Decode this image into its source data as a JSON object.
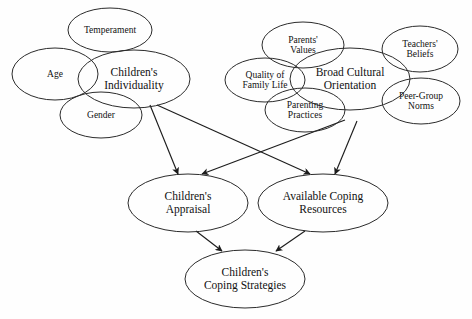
{
  "diagram": {
    "type": "concept-map",
    "background_color": "#fefefe",
    "stroke_color": "#2b2b2b",
    "text_color": "#111111",
    "nodes": [
      {
        "id": "temperament",
        "label": "Temperament",
        "cx": 110,
        "cy": 30,
        "rx": 42,
        "ry": 22,
        "font_size": 9.5
      },
      {
        "id": "age",
        "label": "Age",
        "cx": 55,
        "cy": 74,
        "rx": 43,
        "ry": 26,
        "font_size": 9.5
      },
      {
        "id": "individuality",
        "label": "Children's\nIndividuality",
        "cx": 134,
        "cy": 79,
        "rx": 56,
        "ry": 29,
        "font_size": 11.5
      },
      {
        "id": "gender",
        "label": "Gender",
        "cx": 101,
        "cy": 115,
        "rx": 41,
        "ry": 23,
        "font_size": 9.5
      },
      {
        "id": "parents_values",
        "label": "Parents'\nValues",
        "cx": 303,
        "cy": 45,
        "rx": 41,
        "ry": 23,
        "font_size": 9.5
      },
      {
        "id": "family_life",
        "label": "Quality of\nFamily Life",
        "cx": 265,
        "cy": 80,
        "rx": 40,
        "ry": 22,
        "font_size": 9.5
      },
      {
        "id": "broad_cultural",
        "label": "Broad Cultural\nOrientation",
        "cx": 350,
        "cy": 79,
        "rx": 60,
        "ry": 31,
        "font_size": 11.5
      },
      {
        "id": "parenting",
        "label": "Parenting\nPractices",
        "cx": 305,
        "cy": 110,
        "rx": 40,
        "ry": 22,
        "font_size": 9.5
      },
      {
        "id": "teachers",
        "label": "Teachers'\nBeliefs",
        "cx": 420,
        "cy": 49,
        "rx": 38,
        "ry": 23,
        "font_size": 9.5
      },
      {
        "id": "peer_group",
        "label": "Peer-Group\nNorms",
        "cx": 421,
        "cy": 101,
        "rx": 39,
        "ry": 23,
        "font_size": 9.5
      },
      {
        "id": "appraisal",
        "label": "Children's\nAppraisal",
        "cx": 188,
        "cy": 203,
        "rx": 60,
        "ry": 29,
        "font_size": 11.5
      },
      {
        "id": "coping_res",
        "label": "Available Coping\nResources",
        "cx": 323,
        "cy": 203,
        "rx": 65,
        "ry": 29,
        "font_size": 11.5
      },
      {
        "id": "coping_strat",
        "label": "Children's\nCoping Strategies",
        "cx": 245,
        "cy": 279,
        "rx": 60,
        "ry": 29,
        "font_size": 11.5
      }
    ],
    "edges": [
      {
        "id": "individuality-to-appraisal",
        "from": "individuality",
        "to": "appraisal",
        "x1": 150,
        "y1": 105,
        "x2": 178,
        "y2": 174
      },
      {
        "id": "individuality-to-resources",
        "from": "individuality",
        "to": "coping_res",
        "x1": 157,
        "y1": 105,
        "x2": 310,
        "y2": 174
      },
      {
        "id": "cultural-to-appraisal",
        "from": "broad_cultural",
        "to": "appraisal",
        "x1": 345,
        "y1": 120,
        "x2": 202,
        "y2": 174
      },
      {
        "id": "cultural-to-resources",
        "from": "broad_cultural",
        "to": "coping_res",
        "x1": 357,
        "y1": 121,
        "x2": 335,
        "y2": 174
      },
      {
        "id": "appraisal-to-strategies",
        "from": "appraisal",
        "to": "coping_strat",
        "x1": 196,
        "y1": 231,
        "x2": 222,
        "y2": 251
      },
      {
        "id": "resources-to-strategies",
        "from": "coping_res",
        "to": "coping_strat",
        "x1": 305,
        "y1": 231,
        "x2": 276,
        "y2": 251
      }
    ]
  }
}
